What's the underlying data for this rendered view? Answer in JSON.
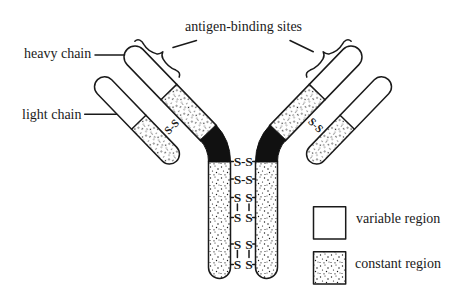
{
  "labels": {
    "antigen_binding_sites": "antigen-binding sites",
    "heavy_chain": "heavy chain",
    "light_chain": "light chain"
  },
  "interchain_bonds": {
    "left_arm": "S-S",
    "right_arm": "S-S"
  },
  "hinge_disulfides": [
    {
      "left": "S",
      "link": "-",
      "right": "S"
    },
    {
      "left": "S",
      "link": "-",
      "right": "S"
    },
    {
      "left": "S",
      "link": "",
      "right": "S",
      "vertical_link_below": true
    },
    {
      "left": "S",
      "link": "",
      "right": "S"
    },
    {
      "left": "S",
      "link": "",
      "right": "S",
      "vertical_link_below": true
    },
    {
      "left": "S",
      "link": "",
      "right": "S"
    }
  ],
  "legend": [
    {
      "label": "variable region",
      "pattern": "plain"
    },
    {
      "label": "constant region",
      "pattern": "stippled"
    }
  ],
  "colors": {
    "ink": "#1a1a1a",
    "background": "#ffffff",
    "hinge": "#111111"
  }
}
